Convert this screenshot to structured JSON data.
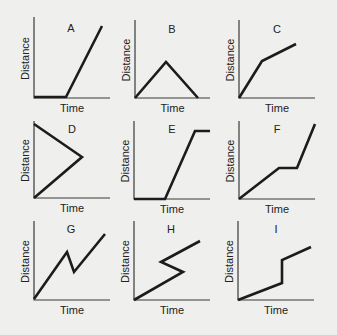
{
  "chart_data": [
    {
      "type": "line",
      "title": "A",
      "xlabel": "Time",
      "ylabel": "Distance",
      "description": "At rest, then constant fast motion",
      "frame": {
        "x0": 34,
        "x1": 110,
        "ytop": 17,
        "ybase": 98
      },
      "points": [
        [
          34,
          97
        ],
        [
          66,
          97
        ],
        [
          102,
          26
        ]
      ],
      "title_pos": [
        71,
        32
      ]
    },
    {
      "type": "line",
      "title": "B",
      "xlabel": "Time",
      "ylabel": "Distance",
      "description": "Moves away then returns to start",
      "frame": {
        "x0": 135,
        "x1": 210,
        "ytop": 20,
        "ybase": 98
      },
      "points": [
        [
          135,
          98
        ],
        [
          166,
          62
        ],
        [
          198,
          98
        ]
      ],
      "title_pos": [
        172,
        33
      ]
    },
    {
      "type": "line",
      "title": "C",
      "xlabel": "Time",
      "ylabel": "Distance",
      "description": "Fast then slower constant motion",
      "frame": {
        "x0": 239,
        "x1": 315,
        "ytop": 20,
        "ybase": 98
      },
      "points": [
        [
          239,
          98
        ],
        [
          262,
          61
        ],
        [
          296,
          44
        ]
      ],
      "title_pos": [
        277,
        33
      ]
    },
    {
      "type": "line",
      "title": "D",
      "xlabel": "Time",
      "ylabel": "Distance",
      "description": "Impossible graph: line goes backward in time",
      "frame": {
        "x0": 34,
        "x1": 110,
        "ytop": 121,
        "ybase": 198
      },
      "points": [
        [
          34,
          124
        ],
        [
          82,
          157
        ],
        [
          34,
          198
        ]
      ],
      "title_pos": [
        72,
        133
      ]
    },
    {
      "type": "line",
      "title": "E",
      "xlabel": "Time",
      "ylabel": "Distance",
      "description": "At rest, constant motion, then at rest",
      "frame": {
        "x0": 134,
        "x1": 210,
        "ytop": 121,
        "ybase": 199
      },
      "points": [
        [
          134,
          199
        ],
        [
          165,
          199
        ],
        [
          195,
          131
        ],
        [
          210,
          131
        ]
      ],
      "title_pos": [
        172,
        133
      ]
    },
    {
      "type": "line",
      "title": "F",
      "xlabel": "Time",
      "ylabel": "Distance",
      "description": "Constant motion, stop, then faster motion",
      "frame": {
        "x0": 239,
        "x1": 315,
        "ytop": 121,
        "ybase": 199
      },
      "points": [
        [
          239,
          199
        ],
        [
          279,
          168
        ],
        [
          297,
          168
        ],
        [
          315,
          124
        ]
      ],
      "title_pos": [
        277,
        133
      ]
    },
    {
      "type": "line",
      "title": "G",
      "xlabel": "Time",
      "ylabel": "Distance",
      "description": "Moves away, comes back partially, moves away again",
      "frame": {
        "x0": 34,
        "x1": 110,
        "ytop": 221,
        "ybase": 300
      },
      "points": [
        [
          34,
          299
        ],
        [
          67,
          252
        ],
        [
          74,
          272
        ],
        [
          105,
          234
        ]
      ],
      "title_pos": [
        71,
        233
      ]
    },
    {
      "type": "line",
      "title": "H",
      "xlabel": "Time",
      "ylabel": "Distance",
      "description": "Impossible graph: line goes backward in time",
      "frame": {
        "x0": 134,
        "x1": 210,
        "ytop": 221,
        "ybase": 300
      },
      "points": [
        [
          134,
          300
        ],
        [
          183,
          272
        ],
        [
          161,
          262
        ],
        [
          200,
          241
        ]
      ],
      "title_pos": [
        171,
        233
      ]
    },
    {
      "type": "line",
      "title": "I",
      "xlabel": "Time",
      "ylabel": "Distance",
      "description": "Impossible graph: vertical jump (instantaneous distance change)",
      "frame": {
        "x0": 238,
        "x1": 314,
        "ytop": 221,
        "ybase": 300
      },
      "points": [
        [
          238,
          300
        ],
        [
          282,
          283
        ],
        [
          282,
          260
        ],
        [
          311,
          247
        ]
      ],
      "title_pos": [
        276,
        233
      ]
    }
  ],
  "styles": {
    "line_color": "#1c1c1c",
    "axis_color": "#3a3a3a",
    "background": "#efefed"
  }
}
